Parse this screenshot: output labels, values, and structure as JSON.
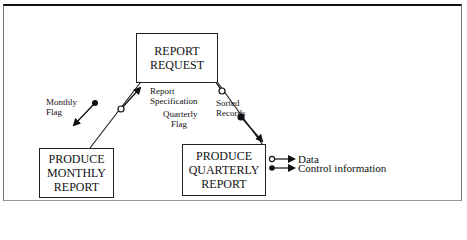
{
  "diagram": {
    "nodes": [
      {
        "id": "report-request",
        "lines": [
          "REPORT",
          "REQUEST"
        ]
      },
      {
        "id": "produce-monthly-report",
        "lines": [
          "PRODUCE",
          "MONTHLY",
          "REPORT"
        ]
      },
      {
        "id": "produce-quarterly-report",
        "lines": [
          "PRODUCE",
          "QUARTERLY",
          "REPORT"
        ]
      }
    ],
    "flows": [
      {
        "label_lines": [
          "Monthly",
          "Flag"
        ],
        "type": "control",
        "from": "report-request",
        "to": "produce-monthly-report"
      },
      {
        "label_lines": [
          "Report",
          "Specification"
        ],
        "type": "data",
        "from": "produce-monthly-report",
        "to": "report-request"
      },
      {
        "label_lines": [
          "Quarterly",
          "Flag"
        ],
        "type": "control",
        "from": "report-request",
        "to": "produce-quarterly-report"
      },
      {
        "label_lines": [
          "Sorted",
          "Records"
        ],
        "type": "data",
        "from": "produce-quarterly-report",
        "to": "report-request"
      }
    ],
    "legend": [
      {
        "type": "data",
        "label": "Data"
      },
      {
        "type": "control",
        "label": "Control information"
      }
    ]
  }
}
